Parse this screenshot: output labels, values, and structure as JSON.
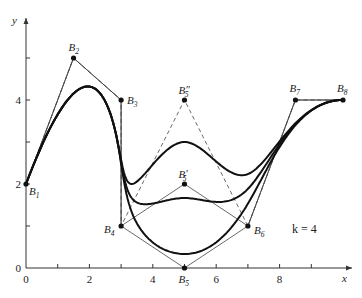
{
  "chart_data": {
    "type": "line",
    "title": "",
    "xlabel": "x",
    "ylabel": "y",
    "xlim": [
      0,
      10
    ],
    "ylim": [
      0,
      5.5
    ],
    "grid": false,
    "x_ticks": [
      1,
      2,
      3,
      4,
      5,
      6,
      7,
      8,
      9
    ],
    "x_tick_labels": [
      {
        "value": 0,
        "label": "0"
      },
      {
        "value": 2,
        "label": "2"
      },
      {
        "value": 4,
        "label": "4"
      },
      {
        "value": 6,
        "label": "6"
      },
      {
        "value": 8,
        "label": "8"
      }
    ],
    "y_ticks": [
      1,
      2,
      3,
      4,
      5
    ],
    "y_tick_labels": [
      {
        "value": 0,
        "label": "0"
      },
      {
        "value": 2,
        "label": "2"
      },
      {
        "value": 4,
        "label": "4"
      }
    ],
    "annotation": "k = 4",
    "order_k": 4,
    "control_points": [
      {
        "name": "B",
        "sub": "1",
        "prime": "",
        "x": 0,
        "y": 2
      },
      {
        "name": "B",
        "sub": "2",
        "prime": "",
        "x": 1.5,
        "y": 5
      },
      {
        "name": "B",
        "sub": "3",
        "prime": "",
        "x": 3,
        "y": 4
      },
      {
        "name": "B",
        "sub": "4",
        "prime": "",
        "x": 3,
        "y": 1
      },
      {
        "name": "B",
        "sub": "5",
        "prime": "",
        "x": 5,
        "y": 0
      },
      {
        "name": "B",
        "sub": "5",
        "prime": "′",
        "x": 5,
        "y": 2
      },
      {
        "name": "B",
        "sub": "5",
        "prime": "″",
        "x": 5,
        "y": 4
      },
      {
        "name": "B",
        "sub": "6",
        "prime": "",
        "x": 7,
        "y": 1
      },
      {
        "name": "B",
        "sub": "7",
        "prime": "",
        "x": 8.5,
        "y": 4
      },
      {
        "name": "B",
        "sub": "8",
        "prime": "",
        "x": 10,
        "y": 4
      }
    ],
    "series": [
      {
        "name": "curve with B5",
        "polygon": [
          "B1",
          "B2",
          "B3",
          "B4",
          "B5",
          "B6",
          "B7",
          "B8"
        ],
        "points": [
          [
            0,
            2
          ],
          [
            1.5,
            5
          ],
          [
            3,
            4
          ],
          [
            3,
            1
          ],
          [
            5,
            0
          ],
          [
            7,
            1
          ],
          [
            8.5,
            4
          ],
          [
            10,
            4
          ]
        ],
        "polygon_style": "solid"
      },
      {
        "name": "curve with B5'",
        "polygon": [
          "B1",
          "B2",
          "B3",
          "B4",
          "B5'",
          "B6",
          "B7",
          "B8"
        ],
        "points": [
          [
            0,
            2
          ],
          [
            1.5,
            5
          ],
          [
            3,
            4
          ],
          [
            3,
            1
          ],
          [
            5,
            2
          ],
          [
            7,
            1
          ],
          [
            8.5,
            4
          ],
          [
            10,
            4
          ]
        ],
        "polygon_style": "solid"
      },
      {
        "name": "curve with B5''",
        "polygon": [
          "B1",
          "B2",
          "B3",
          "B4",
          "B5''",
          "B6",
          "B7",
          "B8"
        ],
        "points": [
          [
            0,
            2
          ],
          [
            1.5,
            5
          ],
          [
            3,
            4
          ],
          [
            3,
            1
          ],
          [
            5,
            4
          ],
          [
            7,
            1
          ],
          [
            8.5,
            4
          ],
          [
            10,
            4
          ]
        ],
        "polygon_style": "dashed"
      }
    ]
  },
  "labels": {
    "x_axis": "x",
    "y_axis": "y",
    "annotation": "k = 4"
  }
}
